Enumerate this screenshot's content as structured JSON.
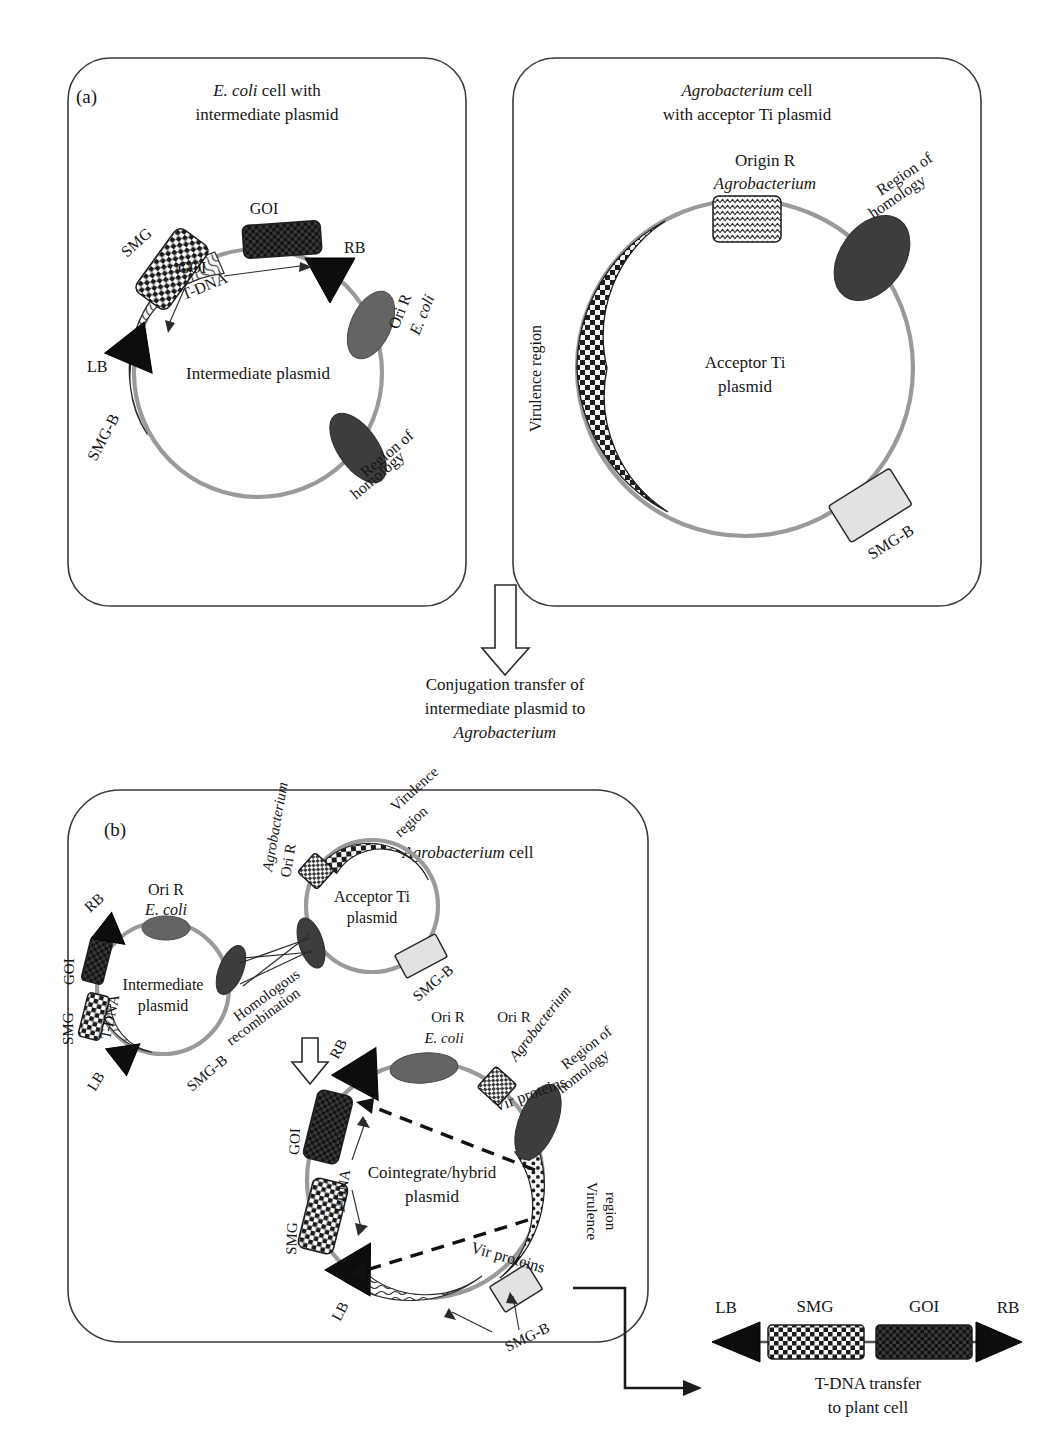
{
  "figure": {
    "kind": "scientific-diagram",
    "topic": "Cointegrate vector system for Agrobacterium-mediated plant transformation",
    "cropped_header": "y"
  },
  "panel_a": {
    "tag": "(a)",
    "ecoli_cell": {
      "title_line1_italic": "E. coli",
      "title_line1_rest": " cell with",
      "title_line2": "intermediate plasmid",
      "plasmid_name": "Intermediate plasmid",
      "features": {
        "smg": "SMG",
        "goi_box_label": "GOI",
        "goi_inner_label": "GOI",
        "tdna": "T-DNA",
        "rb": "RB",
        "lb": "LB",
        "ori_r_line1": "Ori R",
        "ori_r_line2_italic": "E. coli",
        "region_homology_line1": "Region of",
        "region_homology_line2": "homology",
        "smg_b": "SMG-B"
      }
    },
    "agro_cell": {
      "title_line1_italic": "Agrobacterium",
      "title_line1_rest": " cell",
      "title_line2": "with acceptor Ti plasmid",
      "plasmid_name_line1": "Acceptor Ti",
      "plasmid_name_line2": "plasmid",
      "features": {
        "origin_r_line1": "Origin R",
        "origin_r_line2_italic": "Agrobacterium",
        "region_homology_line1": "Region of",
        "region_homology_line2": "homology",
        "virulence_region": "Virulence region",
        "smg_b": "SMG-B"
      }
    }
  },
  "transition": {
    "arrow": "down-open-arrow",
    "caption_line1": "Conjugation transfer of",
    "caption_line2": "intermediate plasmid to",
    "caption_line3_italic": "Agrobacterium"
  },
  "panel_b": {
    "tag": "(b)",
    "cell_title_italic": "Agrobacterium",
    "cell_title_rest": " cell",
    "intermediate_plasmid": {
      "name_line1": "Intermediate",
      "name_line2": "plasmid",
      "rb": "RB",
      "lb": "LB",
      "goi": "GOI",
      "smg": "SMG",
      "tdna": "T-DNA",
      "ori_r_line1": "Ori R",
      "ori_r_line2_italic": "E. coli",
      "smg_b": "SMG-B"
    },
    "acceptor_ti_plasmid": {
      "name_line1": "Acceptor Ti",
      "name_line2": "plasmid",
      "ori_r_line1": "Ori R",
      "ori_r_line2_italic": "Agrobacterium",
      "virulence_line1": "Virulence",
      "virulence_line2": "region",
      "smg_b": "SMG-B"
    },
    "recombination": {
      "label_line1": "Homologous",
      "label_line2": "recombination",
      "arrow": "down-open-arrow"
    },
    "cointegrate_plasmid": {
      "name_line1": "Cointegrate/hybrid",
      "name_line2": "plasmid",
      "rb": "RB",
      "lb": "LB",
      "goi": "GOI",
      "smg": "SMG",
      "tdna": "T-DNA",
      "ori_r_ecoli_line1": "Ori R",
      "ori_r_ecoli_line2_italic": "E. coli",
      "ori_r_agro_line1": "Ori R",
      "ori_r_agro_line2_italic": "Agrobacterium",
      "region_homology_line1": "Region of",
      "region_homology_line2": "homology",
      "virulence_line1": "Virulence",
      "virulence_line2": "region",
      "smg_b": "SMG-B",
      "vir_proteins_top": "Vir proteins",
      "vir_proteins_bottom": "Vir proteins"
    }
  },
  "tdna_transfer": {
    "lb": "LB",
    "smg": "SMG",
    "goi": "GOI",
    "rb": "RB",
    "caption_line1": "T-DNA transfer",
    "caption_line2": "to plant cell"
  },
  "colors": {
    "ring": "#9a9a9a",
    "ori_ellipse": "#646464",
    "homology_ellipse": "#3d3d3d",
    "goi_box": "#1a1a1a",
    "smg_box": "#f2f2f2",
    "smgb_box": "#e2e2e2",
    "cell_outline": "#3b3b3b",
    "text": "#151515"
  }
}
